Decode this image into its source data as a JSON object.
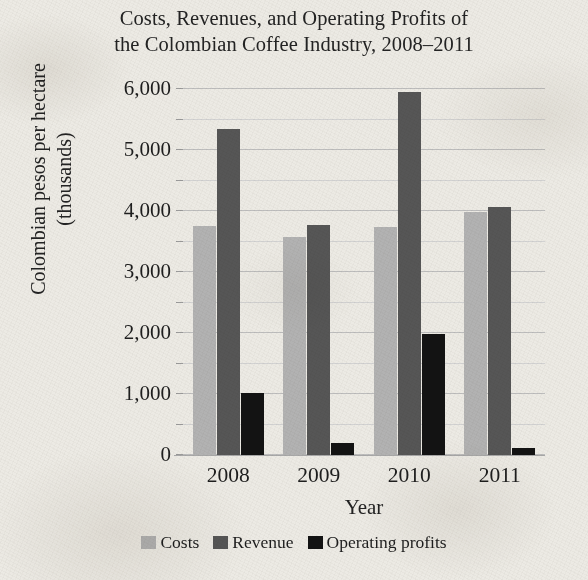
{
  "chart_data": {
    "type": "bar",
    "title": "Costs, Revenues, and Operating Profits of the Colombian Coffee Industry, 2008–2011",
    "title_line1": "Costs, Revenues, and Operating Profits of",
    "title_line2": "the Colombian Coffee Industry, 2008–2011",
    "xlabel": "Year",
    "ylabel": "Colombian pesos per hectare (thousands)",
    "ylabel_line1": "Colombian pesos per hectare",
    "ylabel_line2": "(thousands)",
    "categories": [
      "2008",
      "2009",
      "2010",
      "2011"
    ],
    "series": [
      {
        "name": "Costs",
        "color": "#b2b2b2",
        "values": [
          3760,
          3580,
          3740,
          3990
        ]
      },
      {
        "name": "Revenue",
        "color": "#565656",
        "values": [
          5340,
          3770,
          5950,
          4060
        ]
      },
      {
        "name": "Operating profits",
        "color": "#131313",
        "values": [
          1010,
          200,
          1980,
          110
        ]
      }
    ],
    "ylim": [
      0,
      6000
    ],
    "ytick_values": [
      0,
      1000,
      2000,
      3000,
      4000,
      5000,
      6000
    ],
    "ytick_labels": [
      "0",
      "1,000",
      "2,000",
      "3,000",
      "4,000",
      "5,000",
      "6,000"
    ],
    "minor_tick_step": 500,
    "grid": true,
    "grid_axis": "y",
    "legend_position": "bottom",
    "legend_entries": [
      "Costs",
      "Revenue",
      "Operating profits"
    ]
  }
}
